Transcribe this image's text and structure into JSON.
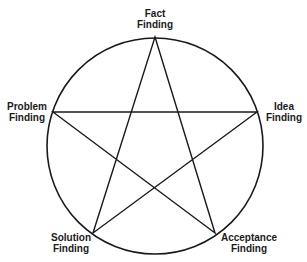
{
  "diagram": {
    "type": "pentagram-in-circle",
    "stroke_color": "#1a1a1a",
    "circle": {
      "cx": 155,
      "cy": 146,
      "r": 108
    },
    "nodes": [
      {
        "id": "fact",
        "line1": "Fact",
        "line2": "Finding",
        "x": 155,
        "y": 37
      },
      {
        "id": "idea",
        "line1": "Idea",
        "line2": "Finding",
        "x": 257,
        "y": 112
      },
      {
        "id": "acceptance",
        "line1": "Acceptance",
        "line2": "Finding",
        "x": 215,
        "y": 233
      },
      {
        "id": "solution",
        "line1": "Solution",
        "line2": "Finding",
        "x": 93,
        "y": 233
      },
      {
        "id": "problem",
        "line1": "Problem",
        "line2": "Finding",
        "x": 53,
        "y": 112
      }
    ],
    "star_order": [
      "fact",
      "acceptance",
      "problem",
      "idea",
      "solution"
    ]
  }
}
